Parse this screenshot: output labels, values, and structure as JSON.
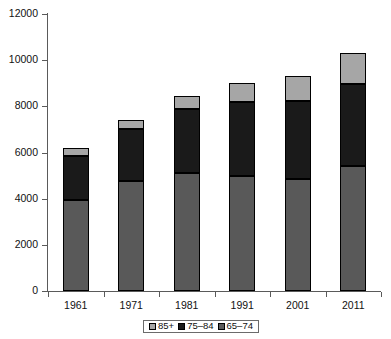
{
  "chart_data": {
    "type": "bar",
    "stacked": true,
    "title": "",
    "subtitle": "",
    "xlabel": "",
    "ylabel": "",
    "categories": [
      "1961",
      "1971",
      "1981",
      "1991",
      "2001",
      "2011"
    ],
    "ylim": [
      0,
      12000
    ],
    "ytick_labels": [
      "0",
      "2000",
      "4000",
      "6000",
      "8000",
      "10000",
      "12000"
    ],
    "ytick_values": [
      0,
      2000,
      4000,
      6000,
      8000,
      10000,
      12000
    ],
    "grid": false,
    "legend_position": "bottom-center",
    "series": [
      {
        "name": "65-74",
        "color": "#595959",
        "values": [
          3950,
          4750,
          5100,
          5000,
          4850,
          5400
        ]
      },
      {
        "name": "75-84",
        "color": "#1a1a1a",
        "values": [
          1900,
          2250,
          2800,
          3200,
          3400,
          3550
        ]
      },
      {
        "name": "85+",
        "color": "#a6a6a6",
        "values": [
          350,
          400,
          550,
          800,
          1050,
          1350
        ]
      }
    ],
    "totals": [
      6200,
      7400,
      8450,
      9000,
      9300,
      10300
    ],
    "stack_order_bottom_to_top": [
      "65-74",
      "75-84",
      "85+"
    ]
  },
  "legend": {
    "entries": [
      {
        "label": "85+",
        "color": "#a6a6a6"
      },
      {
        "label": "75–84",
        "color": "#1a1a1a"
      },
      {
        "label": "65–74",
        "color": "#595959"
      }
    ]
  },
  "axes": {
    "y_labels": [
      "12000",
      "10000",
      "8000",
      "6000",
      "4000",
      "2000",
      "0"
    ],
    "x_labels": [
      "1961",
      "1971",
      "1981",
      "1991",
      "2001",
      "2011"
    ]
  },
  "colors": {
    "axis": "#5a5a5a",
    "text": "#111111",
    "background": "#ffffff",
    "band_85plus": "#a6a6a6",
    "band_75_84": "#1a1a1a",
    "band_65_74": "#595959",
    "outline": "#000000"
  }
}
